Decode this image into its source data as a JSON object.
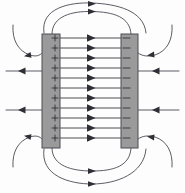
{
  "figure": {
    "caption": "",
    "background_color": "#fdfdfd",
    "width": 185,
    "height": 193
  },
  "plates": {
    "fill_color": "#9a9a9a",
    "border_color": "#4d4d55",
    "left": {
      "label": "positive-plate",
      "polarity": "+",
      "charge_symbol": "+",
      "charge_count": 11,
      "x": 42,
      "y": 34,
      "width": 18,
      "height": 114
    },
    "right": {
      "label": "negative-plate",
      "polarity": "-",
      "charge_symbol": "-",
      "charge_count": 11,
      "x": 121,
      "y": 34,
      "width": 17,
      "height": 114
    }
  },
  "field": {
    "line_color": "#3a3a42",
    "arrow_color": "#2e2e36",
    "direction": "left-to-right",
    "interior_line_count": 11,
    "interior_y_positions": [
      38,
      48,
      58,
      68,
      78,
      88,
      98,
      108,
      118,
      128,
      138
    ],
    "interior_x_start": 60,
    "interior_x_end": 121,
    "interior_arrow_x": 92
  },
  "fringe": {
    "line_color": "#4a4a52",
    "top_arc_count": 2,
    "bottom_arc_count": 2,
    "left_side_line_count": 4,
    "right_side_line_count": 4,
    "description": "Fringing field lines bow outward from the edges of the positive plate and curve back into the negative plate"
  },
  "chart_data": {
    "type": "diagram",
    "elements": [
      {
        "name": "positive-plate",
        "charge": "+",
        "x": 42,
        "width": 18
      },
      {
        "name": "negative-plate",
        "charge": "-",
        "x": 121,
        "width": 17
      },
      {
        "name": "uniform-interior-field",
        "lines": 11,
        "direction": "rightward"
      },
      {
        "name": "fringing-field",
        "arcs": 4
      }
    ]
  }
}
